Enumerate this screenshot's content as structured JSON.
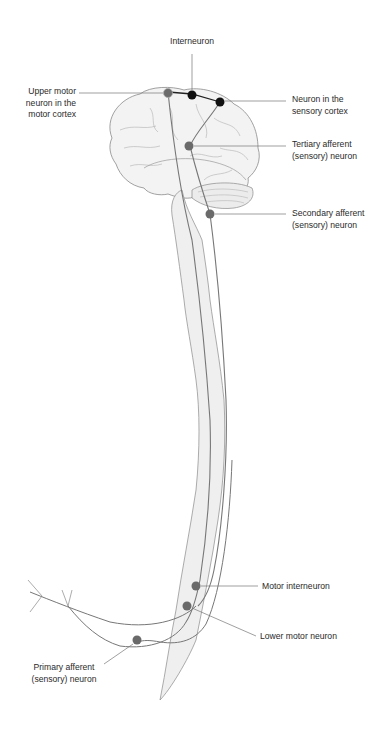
{
  "diagram": {
    "labels": {
      "interneuron": "Interneuron",
      "upper_motor": "Upper motor\nneuron in the\nmotor cortex",
      "sensory_cortex": "Neuron in the\nsensory cortex",
      "tertiary": "Tertiary afferent\n(sensory) neuron",
      "secondary": "Secondary afferent\n(sensory) neuron",
      "motor_interneuron": "Motor interneuron",
      "lower_motor": "Lower motor neuron",
      "primary": "Primary afferent\n(sensory) neuron"
    },
    "colors": {
      "outline": "#888888",
      "fill": "#f0f0f0",
      "neuron_gray": "#6a6a6a",
      "neuron_black": "#111111",
      "leader": "#777777"
    }
  }
}
